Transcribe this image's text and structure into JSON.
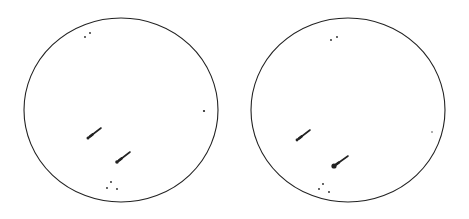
{
  "figure": {
    "width": 469,
    "height": 219,
    "background": "#ffffff",
    "stroke_color": "#222222",
    "panels": [
      {
        "name": "left-disk",
        "circle": {
          "cx": 121,
          "cy": 110,
          "rx": 97,
          "ry": 92
        },
        "dots": [
          {
            "x": 85,
            "y": 37,
            "r": 0.9
          },
          {
            "x": 90,
            "y": 33,
            "r": 0.9
          },
          {
            "x": 204,
            "y": 111,
            "r": 1.1
          },
          {
            "x": 111,
            "y": 182,
            "r": 0.9
          },
          {
            "x": 107,
            "y": 188,
            "r": 0.9
          },
          {
            "x": 117,
            "y": 189,
            "r": 0.9
          }
        ],
        "arrows": [
          {
            "x1": 101,
            "y1": 128,
            "x2": 88,
            "y2": 138,
            "head_r": 1.5
          },
          {
            "x1": 130,
            "y1": 152,
            "x2": 117,
            "y2": 162,
            "head_r": 1.8
          }
        ]
      },
      {
        "name": "right-disk",
        "circle": {
          "cx": 348,
          "cy": 110,
          "rx": 97,
          "ry": 92
        },
        "dots": [
          {
            "x": 331,
            "y": 40,
            "r": 0.9
          },
          {
            "x": 337,
            "y": 37,
            "r": 0.9
          },
          {
            "x": 432,
            "y": 132,
            "r": 0.7
          },
          {
            "x": 323,
            "y": 184,
            "r": 0.9
          },
          {
            "x": 319,
            "y": 189,
            "r": 0.9
          },
          {
            "x": 329,
            "y": 192,
            "r": 0.9
          }
        ],
        "arrows": [
          {
            "x1": 310,
            "y1": 130,
            "x2": 297,
            "y2": 140,
            "head_r": 1.4
          },
          {
            "x1": 348,
            "y1": 156,
            "x2": 334,
            "y2": 166,
            "head_r": 2.6
          }
        ]
      }
    ]
  }
}
